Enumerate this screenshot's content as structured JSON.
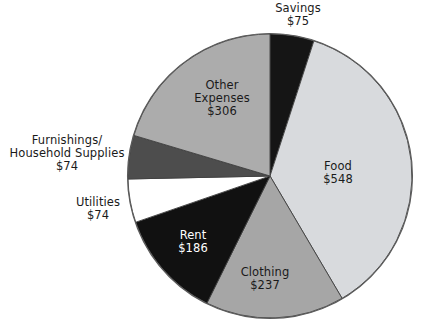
{
  "chart_data": {
    "type": "pie",
    "title": "",
    "subtitle": "",
    "xlabel": "",
    "ylabel": "",
    "legend_position": "none",
    "grid": false,
    "value_prefix": "$",
    "total": 1500,
    "start_angle_deg": 0,
    "direction": "clockwise",
    "categories": [
      "Savings",
      "Food",
      "Clothing",
      "Rent",
      "Utilities",
      "Furnishings/Household Supplies",
      "Other Expenses"
    ],
    "values": [
      75,
      548,
      237,
      186,
      74,
      74,
      306
    ],
    "colors": [
      "#151515",
      "#d8dadd",
      "#a6a6a6",
      "#111111",
      "#ffffff",
      "#4d4d4d",
      "#acacac"
    ],
    "slices": [
      {
        "name": "Savings",
        "value": 75,
        "value_text": "$75",
        "label_lines": [
          "Savings",
          "$75"
        ],
        "color": "#151515",
        "text_color": "#1a1a1a",
        "label_placement": "outside",
        "start_deg": 0,
        "end_deg": 18
      },
      {
        "name": "Food",
        "value": 548,
        "value_text": "$548",
        "label_lines": [
          "Food",
          "$548"
        ],
        "color": "#d8dadd",
        "text_color": "#1a1a1a",
        "label_placement": "inside",
        "start_deg": 18,
        "end_deg": 149.5
      },
      {
        "name": "Clothing",
        "value": 237,
        "value_text": "$237",
        "label_lines": [
          "Clothing",
          "$237"
        ],
        "color": "#a6a6a6",
        "text_color": "#1a1a1a",
        "label_placement": "inside",
        "start_deg": 149.5,
        "end_deg": 206.4
      },
      {
        "name": "Rent",
        "value": 186,
        "value_text": "$186",
        "label_lines": [
          "Rent",
          "$186"
        ],
        "color": "#111111",
        "text_color": "#ffffff",
        "label_placement": "inside",
        "start_deg": 206.4,
        "end_deg": 251
      },
      {
        "name": "Utilities",
        "value": 74,
        "value_text": "$74",
        "label_lines": [
          "Utilities",
          "$74"
        ],
        "color": "#ffffff",
        "text_color": "#1a1a1a",
        "label_placement": "outside",
        "start_deg": 251,
        "end_deg": 268.8
      },
      {
        "name": "Furnishings/Household Supplies",
        "value": 74,
        "value_text": "$74",
        "label_lines": [
          "Furnishings/",
          "Household Supplies",
          "$74"
        ],
        "color": "#4d4d4d",
        "text_color": "#1a1a1a",
        "label_placement": "outside",
        "start_deg": 268.8,
        "end_deg": 286.6
      },
      {
        "name": "Other Expenses",
        "value": 306,
        "value_text": "$306",
        "label_lines": [
          "Other",
          "Expenses",
          "$306"
        ],
        "color": "#acacac",
        "text_color": "#1a1a1a",
        "label_placement": "inside",
        "start_deg": 286.6,
        "end_deg": 360
      }
    ]
  },
  "labels": {
    "savings": {
      "line1": "Savings",
      "line2": "$75"
    },
    "food": {
      "line1": "Food",
      "line2": "$548"
    },
    "clothing": {
      "line1": "Clothing",
      "line2": "$237"
    },
    "rent": {
      "line1": "Rent",
      "line2": "$186"
    },
    "utilities": {
      "line1": "Utilities",
      "line2": "$74"
    },
    "furnishings": {
      "line1": "Furnishings/",
      "line2": "Household Supplies",
      "line3": "$74"
    },
    "other": {
      "line1": "Other",
      "line2": "Expenses",
      "line3": "$306"
    }
  }
}
